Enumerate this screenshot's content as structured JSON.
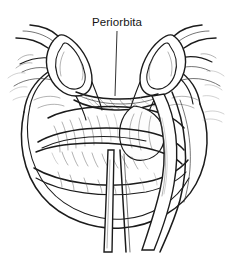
{
  "figure": {
    "kind": "medical-line-art-illustration",
    "width": 234,
    "height": 254,
    "background_color": "#ffffff",
    "ink_color": "#1b1b1b",
    "hatch_color": "#565656",
    "faint_color": "#8a8a8a"
  },
  "annotations": {
    "labels": [
      {
        "id": "periorbita",
        "text": "Periorbita",
        "x": 117,
        "y": 26,
        "anchor": "middle",
        "leader": {
          "from_x": 117,
          "from_y": 31,
          "to_x": 115,
          "to_y": 96
        }
      }
    ]
  },
  "parts": {
    "left_retractor": "hook-retractor-left",
    "right_retractor": "hook-retractor-right",
    "globe": "orbital-globe",
    "periorbita_membrane": "periorbita-membrane",
    "lower_instrument": "instrument-shaft-lower-left",
    "right_instrument": "instrument-shaft-right",
    "bone_rim": "orbital-rim"
  }
}
